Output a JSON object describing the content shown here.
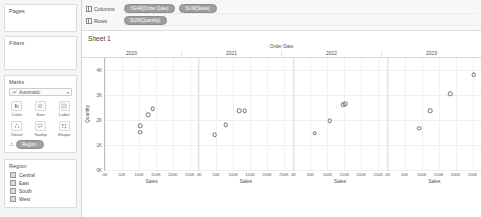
{
  "sidebar": {
    "pages": {
      "title": "Pages"
    },
    "filters": {
      "title": "Filters"
    },
    "marks": {
      "title": "Marks",
      "mark_type": "Automatic",
      "caret": "▾",
      "buttons": [
        {
          "label": "Color",
          "icon": "color-palette-icon"
        },
        {
          "label": "Size",
          "icon": "size-circle-icon"
        },
        {
          "label": "Label",
          "icon": "label-text-icon"
        },
        {
          "label": "Detail",
          "icon": "detail-icon"
        },
        {
          "label": "Tooltip",
          "icon": "tooltip-icon"
        },
        {
          "label": "Shape",
          "icon": "shape-icon"
        }
      ],
      "pill": "Region"
    },
    "legend": {
      "title": "Region",
      "items": [
        {
          "label": "Central"
        },
        {
          "label": "East"
        },
        {
          "label": "South"
        },
        {
          "label": "West"
        }
      ]
    }
  },
  "shelves": {
    "columns": {
      "label": "Columns",
      "pills": [
        "YEAR(Order Date)",
        "SUM(Sales)"
      ]
    },
    "rows": {
      "label": "Rows",
      "pills": [
        "SUM(Quantity)"
      ]
    }
  },
  "sheet": {
    "title": "Sheet 1"
  },
  "chart_data": {
    "type": "scatter",
    "title": "Sheet 1",
    "column_header": "Order Date",
    "xlabel": "Sales",
    "ylabel": "Quantity",
    "ylim": [
      0,
      4500
    ],
    "yticks": [
      "4K",
      "3K",
      "2K",
      "1K",
      "0K"
    ],
    "ytick_values": [
      4000,
      3000,
      2000,
      1000,
      0
    ],
    "xlim": [
      0,
      275000
    ],
    "xticks": [
      "0K",
      "50K",
      "100K",
      "150K",
      "200K",
      "250K"
    ],
    "xtick_values": [
      0,
      50000,
      100000,
      150000,
      200000,
      250000
    ],
    "grid": true,
    "legend_position": "right-sidebar",
    "panels": [
      {
        "year": "2020",
        "points": [
          {
            "region": "South",
            "sales": 103000,
            "quantity": 1650
          },
          {
            "region": "Central",
            "sales": 104000,
            "quantity": 1900
          },
          {
            "region": "East",
            "sales": 128000,
            "quantity": 2350
          },
          {
            "region": "West",
            "sales": 141000,
            "quantity": 2600
          }
        ]
      },
      {
        "year": "2021",
        "points": [
          {
            "region": "South",
            "sales": 45000,
            "quantity": 1550
          },
          {
            "region": "Central",
            "sales": 78000,
            "quantity": 1950
          },
          {
            "region": "East",
            "sales": 118000,
            "quantity": 2500
          },
          {
            "region": "West",
            "sales": 134000,
            "quantity": 2500
          }
        ]
      },
      {
        "year": "2022",
        "points": [
          {
            "region": "South",
            "sales": 62000,
            "quantity": 1600
          },
          {
            "region": "Central",
            "sales": 107000,
            "quantity": 2100
          },
          {
            "region": "East",
            "sales": 146000,
            "quantity": 2750
          },
          {
            "region": "West",
            "sales": 152000,
            "quantity": 2800
          }
        ]
      },
      {
        "year": "2023",
        "points": [
          {
            "region": "South",
            "sales": 93000,
            "quantity": 1800
          },
          {
            "region": "Central",
            "sales": 125000,
            "quantity": 2500
          },
          {
            "region": "East",
            "sales": 185000,
            "quantity": 3200
          },
          {
            "region": "West",
            "sales": 253000,
            "quantity": 3950
          }
        ]
      }
    ]
  },
  "colors": {
    "pill": "#9e9e9e",
    "panel_bg": "#ffffff",
    "gridline": "#eeeeee",
    "axis": "#bdbdbd",
    "point_stroke": "#6f6f6f",
    "sidebar_bg": "#f5f5f5"
  }
}
